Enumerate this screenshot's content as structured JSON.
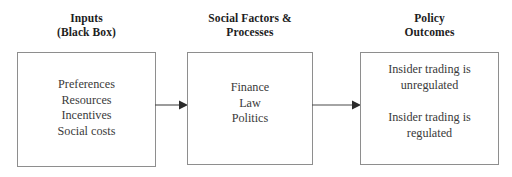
{
  "diagram": {
    "background_color": "#ffffff",
    "border_color": "#8e8e8e",
    "text_color": "#2b2b2b",
    "columns": [
      {
        "id": "inputs",
        "heading": "Inputs\n(Black Box)",
        "blocks": [
          {
            "lines": [
              "Preferences",
              "Resources",
              "Incentives",
              "Social costs"
            ]
          }
        ]
      },
      {
        "id": "social",
        "heading": "Social Factors &\nProcesses",
        "blocks": [
          {
            "lines": [
              "Finance",
              "Law",
              "Politics"
            ]
          }
        ]
      },
      {
        "id": "policy",
        "heading": "Policy\nOutcomes",
        "blocks": [
          {
            "lines": [
              "Insider trading is",
              "unregulated"
            ]
          },
          {
            "lines": [
              "Insider trading is",
              "regulated"
            ]
          }
        ]
      }
    ],
    "connectors": [
      {
        "id": "inputs-to-social",
        "from": "inputs",
        "to": "social",
        "style": "solid-arrow-right"
      },
      {
        "id": "social-to-policy",
        "from": "social",
        "to": "policy",
        "style": "solid-arrow-right"
      }
    ]
  }
}
